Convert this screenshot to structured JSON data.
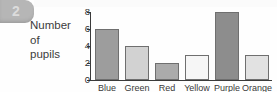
{
  "badge": {
    "number": "2"
  },
  "chart_data": {
    "type": "bar",
    "title": "",
    "ylabel_lines": [
      "Number",
      "of",
      "pupils"
    ],
    "ylabel": "Number of pupils",
    "xlabel": "",
    "categories": [
      "Blue",
      "Green",
      "Red",
      "Yellow",
      "Purple",
      "Orange"
    ],
    "values": [
      6,
      4,
      2,
      3,
      8,
      3
    ],
    "ylim": [
      0,
      8
    ],
    "y_ticks": [
      0,
      2,
      4,
      6,
      8
    ],
    "y_tick_labels": [
      "0",
      "2",
      "4",
      "6",
      "8"
    ],
    "grid": false,
    "legend": false,
    "bar_colors": [
      "#9d9d9d",
      "#d2d2d2",
      "#ababab",
      "#f6f6f6",
      "#8d8d8d",
      "#e2e2e2"
    ],
    "bar_edge_color": "#6f6f6f",
    "axis_color": "#3a3a3a"
  }
}
